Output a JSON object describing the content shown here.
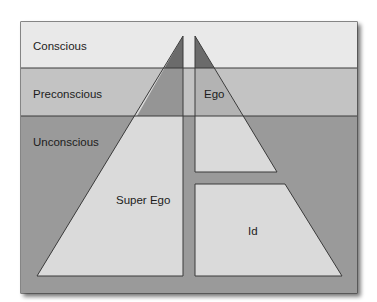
{
  "diagram": {
    "levels": [
      {
        "label": "Conscious",
        "color": "#e9e9e9"
      },
      {
        "label": "Preconscious",
        "color": "#c3c3c3"
      },
      {
        "label": "Unconscious",
        "color": "#9a9a9a"
      }
    ],
    "structures": [
      {
        "label": "Super Ego"
      },
      {
        "label": "Ego"
      },
      {
        "label": "Id"
      }
    ],
    "colors": {
      "structure_fill": "#dadada",
      "apex_dark": "#6b6b6b",
      "apex_mid": "#959595",
      "outline": "#3a3a3a",
      "shadow": "#8a8a8a"
    }
  }
}
